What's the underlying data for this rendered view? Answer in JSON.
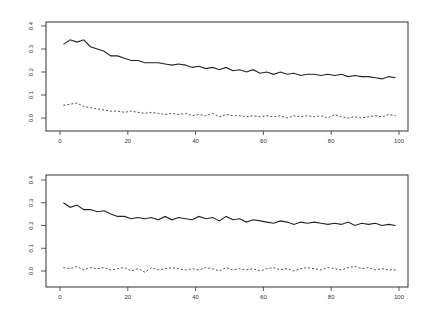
{
  "chart_data": [
    {
      "type": "line",
      "title": "",
      "xlabel": "",
      "ylabel": "",
      "xlim": [
        0,
        100
      ],
      "ylim": [
        -0.03,
        0.42
      ],
      "grid": false,
      "legend": null,
      "x_ticks": [
        "0",
        "20",
        "40",
        "60",
        "80",
        "100"
      ],
      "y_ticks": [
        "0.0",
        "0.1",
        "0.2",
        "0.3",
        "0.4"
      ],
      "x": [
        1,
        3,
        5,
        7,
        9,
        11,
        13,
        15,
        17,
        19,
        21,
        23,
        25,
        27,
        29,
        31,
        33,
        35,
        37,
        39,
        41,
        43,
        45,
        47,
        49,
        51,
        53,
        55,
        57,
        59,
        61,
        63,
        65,
        67,
        69,
        71,
        73,
        75,
        77,
        79,
        81,
        83,
        85,
        87,
        89,
        91,
        93,
        95,
        97,
        99
      ],
      "series": [
        {
          "name": "solid",
          "style": "solid",
          "values": [
            0.32,
            0.34,
            0.33,
            0.34,
            0.31,
            0.3,
            0.29,
            0.27,
            0.27,
            0.26,
            0.25,
            0.25,
            0.24,
            0.24,
            0.24,
            0.235,
            0.23,
            0.235,
            0.23,
            0.22,
            0.225,
            0.215,
            0.22,
            0.21,
            0.22,
            0.205,
            0.21,
            0.2,
            0.21,
            0.195,
            0.2,
            0.19,
            0.2,
            0.19,
            0.195,
            0.185,
            0.19,
            0.19,
            0.185,
            0.19,
            0.185,
            0.19,
            0.18,
            0.185,
            0.18,
            0.18,
            0.175,
            0.17,
            0.18,
            0.175
          ]
        },
        {
          "name": "dashed",
          "style": "dashed",
          "values": [
            0.055,
            0.06,
            0.065,
            0.05,
            0.045,
            0.04,
            0.035,
            0.03,
            0.03,
            0.025,
            0.03,
            0.025,
            0.02,
            0.025,
            0.02,
            0.015,
            0.02,
            0.015,
            0.02,
            0.01,
            0.015,
            0.01,
            0.02,
            0.005,
            0.015,
            0.01,
            0.01,
            0.005,
            0.01,
            0.005,
            0.01,
            0.005,
            0.01,
            0.0,
            0.01,
            0.005,
            0.01,
            0.005,
            0.01,
            0.0,
            0.015,
            0.005,
            0.0,
            0.005,
            0.0,
            0.005,
            0.01,
            0.005,
            0.015,
            0.01
          ]
        }
      ]
    },
    {
      "type": "line",
      "title": "",
      "xlabel": "",
      "ylabel": "",
      "xlim": [
        0,
        100
      ],
      "ylim": [
        -0.03,
        0.42
      ],
      "grid": false,
      "legend": null,
      "x_ticks": [
        "0",
        "20",
        "40",
        "60",
        "80",
        "100"
      ],
      "y_ticks": [
        "0.0",
        "0.1",
        "0.2",
        "0.3",
        "0.4"
      ],
      "x": [
        1,
        3,
        5,
        7,
        9,
        11,
        13,
        15,
        17,
        19,
        21,
        23,
        25,
        27,
        29,
        31,
        33,
        35,
        37,
        39,
        41,
        43,
        45,
        47,
        49,
        51,
        53,
        55,
        57,
        59,
        61,
        63,
        65,
        67,
        69,
        71,
        73,
        75,
        77,
        79,
        81,
        83,
        85,
        87,
        89,
        91,
        93,
        95,
        97,
        99
      ],
      "series": [
        {
          "name": "solid",
          "style": "solid",
          "values": [
            0.3,
            0.28,
            0.29,
            0.27,
            0.27,
            0.26,
            0.265,
            0.25,
            0.24,
            0.24,
            0.23,
            0.235,
            0.23,
            0.235,
            0.225,
            0.24,
            0.225,
            0.235,
            0.23,
            0.225,
            0.24,
            0.23,
            0.235,
            0.22,
            0.24,
            0.225,
            0.23,
            0.215,
            0.225,
            0.22,
            0.215,
            0.21,
            0.22,
            0.215,
            0.205,
            0.215,
            0.21,
            0.215,
            0.21,
            0.205,
            0.21,
            0.205,
            0.215,
            0.2,
            0.21,
            0.205,
            0.21,
            0.2,
            0.205,
            0.2
          ]
        },
        {
          "name": "dashed",
          "style": "dashed",
          "values": [
            0.015,
            0.01,
            0.02,
            0.005,
            0.015,
            0.01,
            0.015,
            0.005,
            0.01,
            0.015,
            0.0,
            0.01,
            -0.005,
            0.015,
            0.005,
            0.01,
            0.015,
            0.01,
            0.005,
            0.01,
            0.005,
            0.015,
            0.01,
            0.0,
            0.015,
            0.005,
            0.01,
            0.005,
            0.01,
            0.0,
            0.01,
            0.015,
            0.005,
            0.01,
            0.0,
            0.01,
            0.015,
            0.01,
            0.005,
            0.015,
            0.01,
            0.005,
            0.015,
            0.02,
            0.01,
            0.015,
            0.005,
            0.01,
            0.005,
            0.005
          ]
        }
      ]
    }
  ],
  "layout": {
    "panels": [
      {
        "box": [
          46,
          22,
          408,
          131
        ],
        "x0px": 60,
        "x100px": 399,
        "y0px": 118,
        "y4px": 26
      },
      {
        "box": [
          46,
          175,
          408,
          287
        ],
        "x0px": 60,
        "x100px": 399,
        "y0px": 271,
        "y4px": 180
      }
    ],
    "colors": {
      "line": "#222222",
      "axis": "#333333",
      "background": "#ffffff"
    }
  }
}
